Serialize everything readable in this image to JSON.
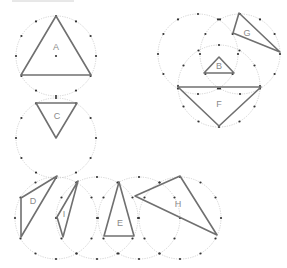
{
  "diagram": {
    "colors": {
      "circle": "#c8c8c8",
      "dot": "#333333",
      "triangle": "#707070",
      "label": "#8a8a8a"
    },
    "circles": [
      {
        "id": "cA",
        "cx": 56,
        "cy": 56,
        "r": 40
      },
      {
        "id": "cC",
        "cx": 56,
        "cy": 138,
        "r": 40
      },
      {
        "id": "cL",
        "cx": 198,
        "cy": 54,
        "r": 40
      },
      {
        "id": "cG",
        "cx": 240,
        "cy": 54,
        "r": 40
      },
      {
        "id": "cBF",
        "cx": 219,
        "cy": 86,
        "r": 41
      },
      {
        "id": "cD",
        "cx": 56,
        "cy": 218,
        "r": 41
      },
      {
        "id": "cI",
        "cx": 97,
        "cy": 218,
        "r": 41
      },
      {
        "id": "cE",
        "cx": 139,
        "cy": 218,
        "r": 41
      },
      {
        "id": "cH",
        "cx": 180,
        "cy": 218,
        "r": 41
      }
    ],
    "triangles": [
      {
        "label": "A",
        "points": [
          [
            56,
            16
          ],
          [
            21,
            75
          ],
          [
            91,
            75
          ]
        ],
        "label_pos": [
          56,
          50
        ]
      },
      {
        "label": "B",
        "points": [
          [
            219,
            57
          ],
          [
            204,
            73
          ],
          [
            234,
            73
          ]
        ],
        "label_pos": [
          219,
          69
        ]
      },
      {
        "label": "C",
        "points": [
          [
            36,
            103
          ],
          [
            77,
            103
          ],
          [
            56,
            138
          ]
        ],
        "label_pos": [
          57,
          119
        ]
      },
      {
        "label": "D",
        "points": [
          [
            57,
            176
          ],
          [
            21,
            198
          ],
          [
            21,
            237
          ]
        ],
        "label_pos": [
          33,
          204
        ]
      },
      {
        "label": "E",
        "points": [
          [
            119,
            182
          ],
          [
            104,
            236
          ],
          [
            134,
            236
          ]
        ],
        "label_pos": [
          120,
          226
        ]
      },
      {
        "label": "F",
        "points": [
          [
            178,
            87
          ],
          [
            261,
            87
          ],
          [
            219,
            126
          ]
        ],
        "label_pos": [
          219,
          107
        ]
      },
      {
        "label": "G",
        "points": [
          [
            239,
            13
          ],
          [
            233,
            33
          ],
          [
            280,
            52
          ]
        ],
        "label_pos": [
          247,
          36
        ]
      },
      {
        "label": "H",
        "points": [
          [
            180,
            176
          ],
          [
            135,
            196
          ],
          [
            217,
            235
          ]
        ],
        "label_pos": [
          178,
          207
        ]
      },
      {
        "label": "I",
        "points": [
          [
            78,
            181
          ],
          [
            57,
            217
          ],
          [
            63,
            237
          ]
        ],
        "label_pos": [
          64,
          217
        ]
      }
    ],
    "center_dots": [
      [
        56,
        56
      ]
    ]
  }
}
